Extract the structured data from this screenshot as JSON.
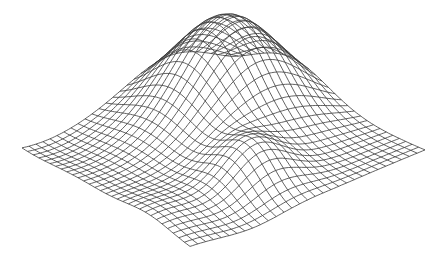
{
  "chart_data": {
    "type": "surface-wireframe",
    "title": "",
    "xlabel": "",
    "ylabel": "",
    "zlabel": "",
    "grid_lines": {
      "u": 30,
      "v": 30
    },
    "line_color": "#3a3a3a",
    "background": "#ffffff",
    "axes_visible": false,
    "projection": {
      "corner_left": [
        22,
        128
      ],
      "corner_back": [
        232,
        68
      ],
      "corner_right": [
        425,
        150
      ],
      "corner_front": [
        190,
        250
      ]
    },
    "surface_features": [
      {
        "name": "main-peak",
        "u": 0.72,
        "v": 0.3,
        "height": 95,
        "width": 0.2
      },
      {
        "name": "secondary-peak",
        "u": 0.45,
        "v": 0.75,
        "height": 40,
        "width": 0.12
      },
      {
        "name": "front-dip",
        "u": 0.05,
        "v": 0.1,
        "height": -22,
        "width": 0.25
      },
      {
        "name": "left-ridge",
        "u": 0.05,
        "v": 0.75,
        "height": 14,
        "width": 0.15
      },
      {
        "name": "right-dip",
        "u": 0.3,
        "v": 1.0,
        "height": -10,
        "width": 0.2
      }
    ]
  }
}
